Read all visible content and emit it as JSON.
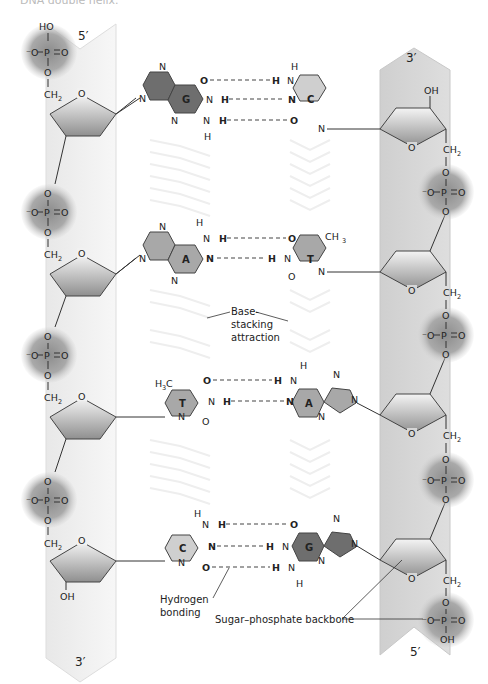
{
  "title": "DNA double helix.",
  "strand_left": {
    "top_end": "5′",
    "bottom_end": "3′",
    "fill": "#f1f1f1"
  },
  "strand_right": {
    "top_end": "3′",
    "bottom_end": "5′",
    "fill": "#d6d6d6"
  },
  "colors": {
    "purine_dark": "#6e6e6e",
    "pyrimidine_light": "#cfcfcf",
    "mid_gray": "#a8a8a8",
    "phosphate": "#8a8a8a",
    "sugar": "#b8b8b8"
  },
  "base_pairs": [
    {
      "left": "G",
      "right": "C",
      "hbonds": 3
    },
    {
      "left": "A",
      "right": "T",
      "hbonds": 2
    },
    {
      "left": "T",
      "right": "A",
      "hbonds": 2
    },
    {
      "left": "C",
      "right": "G",
      "hbonds": 3
    }
  ],
  "phosphate": {
    "P": "P",
    "O": "O",
    "neg_O": "⁻O",
    "HO": "HO",
    "OH": "OH"
  },
  "sugar": {
    "O": "O",
    "CH2": "CH",
    "sub2": "2",
    "OH": "OH"
  },
  "atoms": {
    "N": "N",
    "H": "H",
    "O": "O",
    "CH3": "CH",
    "H3C": "H",
    "C": "C",
    "sub3": "3"
  },
  "labels": {
    "base_stacking_1": "Base-",
    "base_stacking_2": "stacking",
    "base_stacking_3": "attraction",
    "hydrogen_1": "Hydrogen",
    "hydrogen_2": "bonding",
    "backbone": "Sugar–phosphate backbone"
  }
}
